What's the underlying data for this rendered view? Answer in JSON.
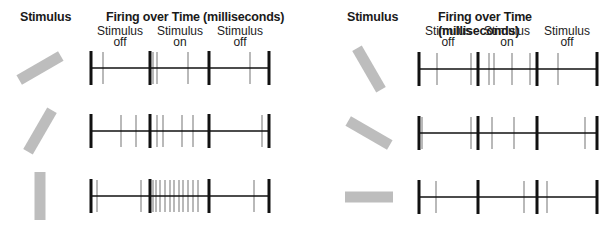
{
  "figure": {
    "panels": [
      {
        "id": "left",
        "stimulus_header": "Stimulus",
        "firing_header": "Firing over Time (milliseconds)",
        "phases": [
          {
            "label1": "Stimulus",
            "label2": "off"
          },
          {
            "label1": "Stimulus",
            "label2": "on"
          },
          {
            "label1": "Stimulus",
            "label2": "off"
          }
        ],
        "rows": [
          {
            "stimulus_orientation_deg": 30,
            "spikes": [
              103,
              153,
              157,
              188,
              250
            ]
          },
          {
            "stimulus_orientation_deg": 60,
            "spikes": [
              121,
              136,
              157,
              163,
              182,
              193,
              262
            ]
          },
          {
            "stimulus_orientation_deg": 90,
            "spikes": [
              97,
              141,
              153,
              156,
              160,
              165,
              170,
              174,
              179,
              183,
              188,
              193,
              198,
              254
            ]
          }
        ]
      },
      {
        "id": "right",
        "stimulus_header": "Stimulus",
        "firing_header": "Firing over Time (milliseconds)",
        "phases": [
          {
            "label1": "Stimulus",
            "label2": "off"
          },
          {
            "label1": "Stimulus",
            "label2": "on"
          },
          {
            "label1": "Stimulus",
            "label2": "off"
          }
        ],
        "rows": [
          {
            "stimulus_orientation_deg": 120,
            "spikes": [
              437,
              471,
              489,
              494,
              512,
              530,
              558
            ]
          },
          {
            "stimulus_orientation_deg": 150,
            "spikes": [
              422,
              471,
              492,
              514,
              585
            ]
          },
          {
            "stimulus_orientation_deg": 180,
            "spikes": [
              436,
              524,
              547
            ]
          }
        ]
      }
    ],
    "colors": {
      "bar": "#bdbdbd",
      "axis": "#111111",
      "spike": "#8a8a8a"
    }
  }
}
